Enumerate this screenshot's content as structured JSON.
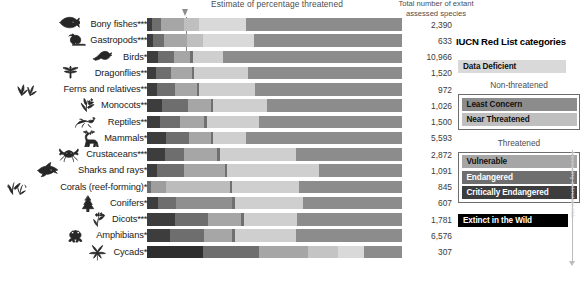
{
  "headers": {
    "estimate_axis": "Estimate of percentage threatened",
    "total_line1": "Total number of extant",
    "total_line2": "assessed species"
  },
  "legend": {
    "title": "IUCN Red List categories",
    "data_deficient": "Data Deficient",
    "non_threatened_header": "Non-threatened",
    "least_concern": "Least Concern",
    "near_threatened": "Near Threatened",
    "threatened_header": "Threatened",
    "vulnerable": "Vulnerable",
    "endangered": "Endangered",
    "critically_endangered": "Critically Endangered",
    "extinct_in_the_wild": "Extinct in the Wild",
    "axis_arrow_label": "Increasing extinction risk"
  },
  "colors": {
    "data_deficient": "#d9d9d9",
    "least_concern": "#8c8c8c",
    "near_threatened": "#bfbfbf",
    "vulnerable": "#a6a6a6",
    "endangered": "#6e6e6e",
    "critically_endangered": "#3d3d3d",
    "extinct_in_the_wild": "#000000",
    "background": "#ffffff",
    "text": "#231f20",
    "muted_text": "#4d4d4d"
  },
  "chart_data": {
    "type": "bar",
    "title": "Estimate of percentage threatened",
    "xlabel": "Estimate of percentage threatened",
    "ylabel": "",
    "xlim": [
      0,
      100
    ],
    "grid": false,
    "stacked": true,
    "orientation": "horizontal",
    "legend_position": "right",
    "series": [
      {
        "name": "Critically Endangered",
        "color": "#3d3d3d"
      },
      {
        "name": "Endangered",
        "color": "#6e6e6e"
      },
      {
        "name": "Vulnerable",
        "color": "#a6a6a6"
      },
      {
        "name": "Near Threatened",
        "color": "#bfbfbf"
      },
      {
        "name": "Data Deficient",
        "color": "#d9d9d9"
      },
      {
        "name": "Least Concern",
        "color": "#8c8c8c"
      }
    ],
    "categories": [
      "Bony fishes",
      "Gastropods",
      "Birds",
      "Dragonflies",
      "Ferns and relatives",
      "Monocots",
      "Reptiles",
      "Mammals",
      "Crustaceans",
      "Sharks and rays",
      "Corals (reef-forming)",
      "Conifers",
      "Dicots",
      "Amphibians",
      "Cycads"
    ],
    "rows": [
      {
        "label": "Bony fishes",
        "asterisks": "***",
        "count": "2,390",
        "icon": "bony-fish-icon",
        "segments": [
          {
            "cat": "Critically Endangered",
            "pct": 2.0,
            "color": "#3d3d3d"
          },
          {
            "cat": "Endangered",
            "pct": 3.5,
            "color": "#6e6e6e"
          },
          {
            "cat": "Vulnerable",
            "pct": 9.0,
            "color": "#a6a6a6"
          },
          {
            "cat": "Near Threatened",
            "pct": 6.0,
            "color": "#bfbfbf"
          },
          {
            "cat": "Data Deficient",
            "pct": 18.5,
            "color": "#d9d9d9"
          },
          {
            "cat": "Least Concern",
            "pct": 61.0,
            "color": "#8c8c8c"
          }
        ]
      },
      {
        "label": "Gastropods",
        "asterisks": "***",
        "count": "633",
        "icon": "snail-icon",
        "segments": [
          {
            "cat": "Critically Endangered",
            "pct": 2.5,
            "color": "#3d3d3d"
          },
          {
            "cat": "Endangered",
            "pct": 4.0,
            "color": "#6e6e6e"
          },
          {
            "cat": "Vulnerable",
            "pct": 9.0,
            "color": "#a6a6a6"
          },
          {
            "cat": "Near Threatened",
            "pct": 6.5,
            "color": "#bfbfbf"
          },
          {
            "cat": "Data Deficient",
            "pct": 20.0,
            "color": "#d9d9d9"
          },
          {
            "cat": "Least Concern",
            "pct": 58.0,
            "color": "#8c8c8c"
          }
        ]
      },
      {
        "label": "Birds",
        "asterisks": "*",
        "count": "10,966",
        "icon": "bird-icon",
        "segments": [
          {
            "cat": "Critically Endangered",
            "pct": 4.5,
            "color": "#3d3d3d"
          },
          {
            "cat": "Endangered",
            "pct": 6.0,
            "color": "#6e6e6e"
          },
          {
            "cat": "Vulnerable",
            "pct": 6.5,
            "color": "#a6a6a6"
          },
          {
            "cat": "Near Threatened",
            "pct": 1.0,
            "color": "#707070"
          },
          {
            "cat": "Data Deficient",
            "pct": 12.0,
            "color": "#cfcfcf"
          },
          {
            "cat": "Least Concern",
            "pct": 70.0,
            "color": "#8c8c8c"
          }
        ]
      },
      {
        "label": "Dragonflies",
        "asterisks": "**",
        "count": "1,520",
        "icon": "dragonfly-icon",
        "segments": [
          {
            "cat": "Critically Endangered",
            "pct": 3.5,
            "color": "#3d3d3d"
          },
          {
            "cat": "Endangered",
            "pct": 6.0,
            "color": "#6e6e6e"
          },
          {
            "cat": "Vulnerable",
            "pct": 8.0,
            "color": "#a6a6a6"
          },
          {
            "cat": "Near Threatened",
            "pct": 1.0,
            "color": "#707070"
          },
          {
            "cat": "Data Deficient",
            "pct": 21.0,
            "color": "#cfcfcf"
          },
          {
            "cat": "Least Concern",
            "pct": 60.5,
            "color": "#8c8c8c"
          }
        ]
      },
      {
        "label": "Ferns and relatives",
        "asterisks": "**",
        "count": "972",
        "icon": "fern-icon",
        "segments": [
          {
            "cat": "Critically Endangered",
            "pct": 4.0,
            "color": "#3d3d3d"
          },
          {
            "cat": "Endangered",
            "pct": 7.0,
            "color": "#6e6e6e"
          },
          {
            "cat": "Vulnerable",
            "pct": 8.5,
            "color": "#a6a6a6"
          },
          {
            "cat": "Near Threatened",
            "pct": 1.0,
            "color": "#707070"
          },
          {
            "cat": "Data Deficient",
            "pct": 22.0,
            "color": "#cfcfcf"
          },
          {
            "cat": "Least Concern",
            "pct": 57.5,
            "color": "#8c8c8c"
          }
        ]
      },
      {
        "label": "Monocots",
        "asterisks": "**",
        "count": "1,026",
        "icon": "monocot-icon",
        "segments": [
          {
            "cat": "Critically Endangered",
            "pct": 6.0,
            "color": "#3d3d3d"
          },
          {
            "cat": "Endangered",
            "pct": 10.0,
            "color": "#6e6e6e"
          },
          {
            "cat": "Vulnerable",
            "pct": 9.0,
            "color": "#a6a6a6"
          },
          {
            "cat": "Near Threatened",
            "pct": 1.0,
            "color": "#707070"
          },
          {
            "cat": "Data Deficient",
            "pct": 21.0,
            "color": "#cfcfcf"
          },
          {
            "cat": "Least Concern",
            "pct": 53.0,
            "color": "#8c8c8c"
          }
        ]
      },
      {
        "label": "Reptiles",
        "asterisks": "**",
        "count": "1,500",
        "icon": "lizard-icon",
        "segments": [
          {
            "cat": "Critically Endangered",
            "pct": 5.0,
            "color": "#3d3d3d"
          },
          {
            "cat": "Endangered",
            "pct": 8.0,
            "color": "#6e6e6e"
          },
          {
            "cat": "Vulnerable",
            "pct": 9.5,
            "color": "#a6a6a6"
          },
          {
            "cat": "Near Threatened",
            "pct": 1.0,
            "color": "#707070"
          },
          {
            "cat": "Data Deficient",
            "pct": 20.5,
            "color": "#cfcfcf"
          },
          {
            "cat": "Least Concern",
            "pct": 56.0,
            "color": "#8c8c8c"
          }
        ]
      },
      {
        "label": "Mammals",
        "asterisks": "*",
        "count": "5,593",
        "icon": "deer-icon",
        "segments": [
          {
            "cat": "Critically Endangered",
            "pct": 7.5,
            "color": "#3d3d3d"
          },
          {
            "cat": "Endangered",
            "pct": 9.0,
            "color": "#6e6e6e"
          },
          {
            "cat": "Vulnerable",
            "pct": 8.5,
            "color": "#a6a6a6"
          },
          {
            "cat": "Near Threatened",
            "pct": 1.0,
            "color": "#707070"
          },
          {
            "cat": "Data Deficient",
            "pct": 13.0,
            "color": "#cfcfcf"
          },
          {
            "cat": "Least Concern",
            "pct": 61.0,
            "color": "#8c8c8c"
          }
        ]
      },
      {
        "label": "Crustaceans",
        "asterisks": "***",
        "count": "2,872",
        "icon": "crab-icon",
        "segments": [
          {
            "cat": "Critically Endangered",
            "pct": 7.0,
            "color": "#3d3d3d"
          },
          {
            "cat": "Endangered",
            "pct": 7.5,
            "color": "#6e6e6e"
          },
          {
            "cat": "Vulnerable",
            "pct": 13.0,
            "color": "#a6a6a6"
          },
          {
            "cat": "Near Threatened",
            "pct": 1.0,
            "color": "#707070"
          },
          {
            "cat": "Data Deficient",
            "pct": 30.0,
            "color": "#cfcfcf"
          },
          {
            "cat": "Least Concern",
            "pct": 41.5,
            "color": "#8c8c8c"
          }
        ]
      },
      {
        "label": "Sharks and rays",
        "asterisks": "*",
        "count": "1,091",
        "icon": "shark-icon",
        "segments": [
          {
            "cat": "Critically Endangered",
            "pct": 4.0,
            "color": "#3d3d3d"
          },
          {
            "cat": "Endangered",
            "pct": 10.5,
            "color": "#6e6e6e"
          },
          {
            "cat": "Vulnerable",
            "pct": 16.0,
            "color": "#a6a6a6"
          },
          {
            "cat": "Near Threatened",
            "pct": 1.0,
            "color": "#707070"
          },
          {
            "cat": "Data Deficient",
            "pct": 36.0,
            "color": "#cfcfcf"
          },
          {
            "cat": "Least Concern",
            "pct": 32.5,
            "color": "#8c8c8c"
          }
        ]
      },
      {
        "label": "Corals (reef-forming)",
        "asterisks": "*",
        "count": "845",
        "icon": "coral-icon",
        "segments": [
          {
            "cat": "Critically Endangered",
            "pct": 1.5,
            "color": "#6e6e6e"
          },
          {
            "cat": "Endangered",
            "pct": 6.0,
            "color": "#9e9e9e"
          },
          {
            "cat": "Vulnerable",
            "pct": 25.0,
            "color": "#bcbcbc"
          },
          {
            "cat": "Near Threatened",
            "pct": 1.0,
            "color": "#707070"
          },
          {
            "cat": "Data Deficient",
            "pct": 26.0,
            "color": "#cfcfcf"
          },
          {
            "cat": "Least Concern",
            "pct": 40.5,
            "color": "#8c8c8c"
          }
        ]
      },
      {
        "label": "Conifers",
        "asterisks": "*",
        "count": "607",
        "icon": "conifer-icon",
        "segments": [
          {
            "cat": "Critically Endangered",
            "pct": 4.5,
            "color": "#3d3d3d"
          },
          {
            "cat": "Endangered",
            "pct": 7.0,
            "color": "#6e6e6e"
          },
          {
            "cat": "Vulnerable",
            "pct": 22.0,
            "color": "#8f8f8f"
          },
          {
            "cat": "Near Threatened",
            "pct": 1.0,
            "color": "#707070"
          },
          {
            "cat": "Data Deficient",
            "pct": 26.5,
            "color": "#cfcfcf"
          },
          {
            "cat": "Least Concern",
            "pct": 39.0,
            "color": "#8c8c8c"
          }
        ]
      },
      {
        "label": "Dicots",
        "asterisks": "***",
        "count": "1,781",
        "icon": "dicot-icon",
        "segments": [
          {
            "cat": "Critically Endangered",
            "pct": 11.0,
            "color": "#3d3d3d"
          },
          {
            "cat": "Endangered",
            "pct": 13.0,
            "color": "#6e6e6e"
          },
          {
            "cat": "Vulnerable",
            "pct": 13.0,
            "color": "#a6a6a6"
          },
          {
            "cat": "Near Threatened",
            "pct": 1.0,
            "color": "#707070"
          },
          {
            "cat": "Data Deficient",
            "pct": 21.0,
            "color": "#cfcfcf"
          },
          {
            "cat": "Least Concern",
            "pct": 41.0,
            "color": "#8c8c8c"
          }
        ]
      },
      {
        "label": "Amphibians",
        "asterisks": "*",
        "count": "6,576",
        "icon": "frog-icon",
        "segments": [
          {
            "cat": "Critically Endangered",
            "pct": 9.0,
            "color": "#3d3d3d"
          },
          {
            "cat": "Endangered",
            "pct": 13.5,
            "color": "#6e6e6e"
          },
          {
            "cat": "Vulnerable",
            "pct": 11.0,
            "color": "#a6a6a6"
          },
          {
            "cat": "Near Threatened",
            "pct": 1.0,
            "color": "#707070"
          },
          {
            "cat": "Data Deficient",
            "pct": 24.0,
            "color": "#cfcfcf"
          },
          {
            "cat": "Least Concern",
            "pct": 41.5,
            "color": "#8c8c8c"
          }
        ]
      },
      {
        "label": "Cycads",
        "asterisks": "*",
        "count": "307",
        "icon": "cycad-icon",
        "segments": [
          {
            "cat": "Critically Endangered",
            "pct": 22.0,
            "color": "#2e2e2e"
          },
          {
            "cat": "Endangered",
            "pct": 22.0,
            "color": "#6e6e6e"
          },
          {
            "cat": "Vulnerable",
            "pct": 19.0,
            "color": "#a6a6a6"
          },
          {
            "cat": "Near Threatened",
            "pct": 12.0,
            "color": "#c4c4c4"
          },
          {
            "cat": "Data Deficient",
            "pct": 10.0,
            "color": "#d9d9d9"
          },
          {
            "cat": "Least Concern",
            "pct": 15.0,
            "color": "#8c8c8c"
          }
        ]
      }
    ]
  }
}
